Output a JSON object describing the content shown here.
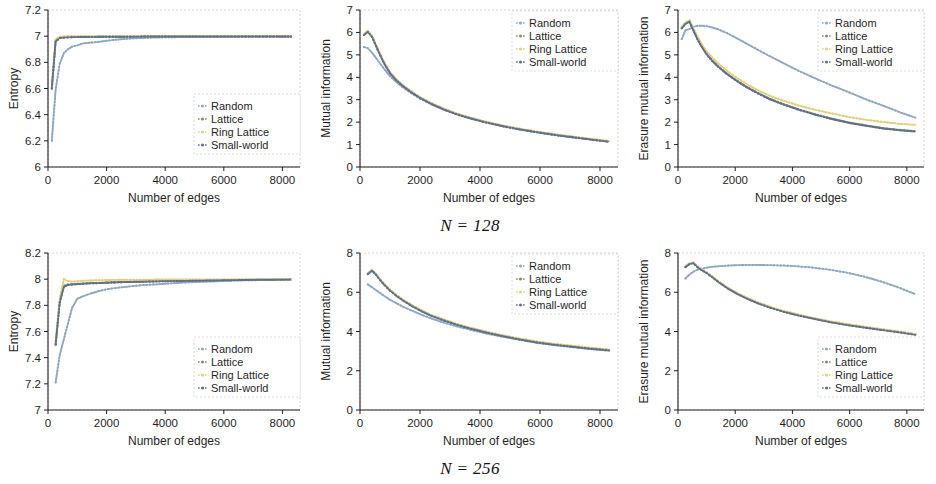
{
  "figure": {
    "captions": [
      {
        "text": "N = 128"
      },
      {
        "text": "N = 256"
      }
    ],
    "xlabel": "Number of edges",
    "series_names": [
      "Random",
      "Lattice",
      "Ring Lattice",
      "Small-world"
    ],
    "colors": {
      "random": "#8fa7c4",
      "lattice": "#7e8f6a",
      "ring_lattice": "#e3cf7a",
      "small_world": "#5f708a",
      "axis": "#1f1f1f",
      "frame": "#c9c9c9"
    }
  },
  "chart_data": [
    {
      "id": "entropy-n128",
      "type": "line",
      "title": "",
      "xlabel": "Number of edges",
      "ylabel": "Entropy",
      "xlim": [
        0,
        8600
      ],
      "ylim": [
        6,
        7.2
      ],
      "xticks": [
        0,
        2000,
        4000,
        6000,
        8000
      ],
      "yticks": [
        "6",
        "6.2",
        "6.4",
        "6.6",
        "6.8",
        "7",
        "7.2"
      ],
      "grid": false,
      "legend_position": "bottom-right",
      "x": [
        130,
        260,
        400,
        540,
        680,
        820,
        1000,
        1200,
        1400,
        1700,
        2000,
        2400,
        2800,
        3200,
        3700,
        4200,
        4800,
        5400,
        6000,
        6600,
        7200,
        7800,
        8300
      ],
      "series": [
        {
          "name": "Random",
          "values": [
            6.2,
            6.59,
            6.79,
            6.87,
            6.9,
            6.92,
            6.93,
            6.945,
            6.95,
            6.955,
            6.965,
            6.975,
            6.982,
            6.986,
            6.99,
            6.992,
            6.993,
            6.995,
            6.996,
            6.997,
            6.997,
            6.998,
            6.998
          ]
        },
        {
          "name": "Lattice",
          "values": [
            6.6,
            6.96,
            6.985,
            6.99,
            6.992,
            6.993,
            6.994,
            6.994,
            6.995,
            6.995,
            6.995,
            6.996,
            6.996,
            6.997,
            6.997,
            6.997,
            6.997,
            6.998,
            6.998,
            6.998,
            6.998,
            6.998,
            6.998
          ]
        },
        {
          "name": "Ring Lattice",
          "values": [
            6.61,
            6.975,
            6.995,
            6.998,
            6.999,
            6.999,
            6.999,
            6.999,
            6.999,
            6.999,
            6.999,
            6.999,
            6.999,
            6.999,
            6.999,
            6.999,
            6.999,
            6.999,
            6.999,
            6.999,
            6.999,
            6.999,
            6.999
          ]
        },
        {
          "name": "Small-world",
          "values": [
            6.6,
            6.96,
            6.985,
            6.989,
            6.991,
            6.992,
            6.993,
            6.994,
            6.994,
            6.995,
            6.995,
            6.996,
            6.996,
            6.997,
            6.997,
            6.997,
            6.998,
            6.998,
            6.998,
            6.998,
            6.998,
            6.998,
            6.998
          ]
        }
      ]
    },
    {
      "id": "mutual-information-n128",
      "type": "line",
      "title": "",
      "xlabel": "Number of edges",
      "ylabel": "Mutual information",
      "xlim": [
        0,
        8600
      ],
      "ylim": [
        0,
        7
      ],
      "xticks": [
        0,
        2000,
        4000,
        6000,
        8000
      ],
      "yticks": [
        "0",
        "1",
        "2",
        "3",
        "4",
        "5",
        "6",
        "7"
      ],
      "grid": false,
      "legend_position": "top-right",
      "x": [
        130,
        260,
        400,
        540,
        680,
        820,
        1000,
        1200,
        1400,
        1700,
        2000,
        2400,
        2800,
        3200,
        3700,
        4200,
        4800,
        5400,
        6000,
        6600,
        7200,
        7800,
        8300
      ],
      "series": [
        {
          "name": "Random",
          "values": [
            5.35,
            5.3,
            5.1,
            4.85,
            4.6,
            4.35,
            4.05,
            3.8,
            3.58,
            3.3,
            3.05,
            2.78,
            2.55,
            2.35,
            2.15,
            1.98,
            1.8,
            1.65,
            1.52,
            1.4,
            1.3,
            1.2,
            1.12
          ]
        },
        {
          "name": "Lattice",
          "values": [
            5.9,
            6.05,
            5.82,
            5.4,
            4.98,
            4.6,
            4.2,
            3.9,
            3.66,
            3.36,
            3.1,
            2.82,
            2.58,
            2.38,
            2.18,
            2.0,
            1.82,
            1.67,
            1.54,
            1.42,
            1.32,
            1.22,
            1.14
          ]
        },
        {
          "name": "Ring Lattice",
          "values": [
            5.92,
            6.08,
            5.85,
            5.43,
            5.02,
            4.64,
            4.23,
            3.93,
            3.68,
            3.38,
            3.12,
            2.84,
            2.6,
            2.4,
            2.2,
            2.02,
            1.84,
            1.69,
            1.56,
            1.44,
            1.34,
            1.24,
            1.16
          ]
        },
        {
          "name": "Small-world",
          "values": [
            5.88,
            6.02,
            5.8,
            5.38,
            4.96,
            4.58,
            4.18,
            3.88,
            3.64,
            3.34,
            3.08,
            2.8,
            2.56,
            2.36,
            2.16,
            1.99,
            1.81,
            1.66,
            1.53,
            1.41,
            1.31,
            1.21,
            1.13
          ]
        }
      ]
    },
    {
      "id": "erasure-mutual-information-n128",
      "type": "line",
      "title": "",
      "xlabel": "Number of edges",
      "ylabel": "Erasure mutual information",
      "xlim": [
        0,
        8600
      ],
      "ylim": [
        0,
        7
      ],
      "xticks": [
        0,
        2000,
        4000,
        6000,
        8000
      ],
      "yticks": [
        "0",
        "1",
        "2",
        "3",
        "4",
        "5",
        "6",
        "7"
      ],
      "grid": false,
      "legend_position": "top-right",
      "x": [
        130,
        260,
        400,
        540,
        680,
        820,
        1000,
        1200,
        1400,
        1700,
        2000,
        2400,
        2800,
        3200,
        3700,
        4200,
        4800,
        5400,
        6000,
        6600,
        7200,
        7800,
        8300
      ],
      "series": [
        {
          "name": "Random",
          "values": [
            5.7,
            6.1,
            6.15,
            6.25,
            6.3,
            6.3,
            6.28,
            6.22,
            6.14,
            5.98,
            5.78,
            5.5,
            5.22,
            4.95,
            4.62,
            4.3,
            3.95,
            3.62,
            3.32,
            3.0,
            2.72,
            2.42,
            2.2
          ]
        },
        {
          "name": "Lattice",
          "values": [
            6.2,
            6.4,
            6.5,
            6.1,
            5.72,
            5.4,
            5.05,
            4.75,
            4.5,
            4.18,
            3.9,
            3.58,
            3.3,
            3.05,
            2.8,
            2.58,
            2.35,
            2.15,
            1.98,
            1.85,
            1.73,
            1.65,
            1.6
          ]
        },
        {
          "name": "Ring Lattice",
          "values": [
            6.25,
            6.45,
            6.55,
            6.18,
            5.82,
            5.5,
            5.15,
            4.88,
            4.62,
            4.3,
            4.02,
            3.7,
            3.42,
            3.18,
            2.95,
            2.75,
            2.55,
            2.38,
            2.22,
            2.1,
            2.0,
            1.92,
            1.88
          ]
        },
        {
          "name": "Small-world",
          "values": [
            6.18,
            6.38,
            6.48,
            6.08,
            5.7,
            5.38,
            5.02,
            4.72,
            4.47,
            4.15,
            3.88,
            3.55,
            3.28,
            3.02,
            2.78,
            2.56,
            2.33,
            2.13,
            1.96,
            1.83,
            1.71,
            1.63,
            1.58
          ]
        }
      ]
    },
    {
      "id": "entropy-n256",
      "type": "line",
      "title": "",
      "xlabel": "Number of edges",
      "ylabel": "Entropy",
      "xlim": [
        0,
        8600
      ],
      "ylim": [
        7,
        8.2
      ],
      "xticks": [
        0,
        2000,
        4000,
        6000,
        8000
      ],
      "yticks": [
        "7",
        "7.2",
        "7.4",
        "7.6",
        "7.8",
        "8",
        "8.2"
      ],
      "grid": false,
      "legend_position": "bottom-right",
      "x": [
        260,
        400,
        540,
        680,
        820,
        1000,
        1200,
        1450,
        1750,
        2050,
        2400,
        2800,
        3250,
        3700,
        4200,
        4700,
        5300,
        5900,
        6500,
        7100,
        7700,
        8300
      ],
      "series": [
        {
          "name": "Random",
          "values": [
            7.21,
            7.42,
            7.54,
            7.66,
            7.78,
            7.85,
            7.87,
            7.89,
            7.91,
            7.925,
            7.935,
            7.945,
            7.955,
            7.96,
            7.968,
            7.975,
            7.98,
            7.985,
            7.99,
            7.992,
            7.995,
            7.998
          ]
        },
        {
          "name": "Lattice",
          "values": [
            7.5,
            7.83,
            7.95,
            7.96,
            7.962,
            7.965,
            7.967,
            7.97,
            7.972,
            7.975,
            7.978,
            7.98,
            7.982,
            7.984,
            7.986,
            7.988,
            7.99,
            7.992,
            7.994,
            7.996,
            7.997,
            7.998
          ]
        },
        {
          "name": "Ring Lattice",
          "values": [
            7.52,
            7.85,
            8.0,
            7.985,
            7.982,
            7.984,
            7.988,
            7.99,
            7.992,
            7.994,
            7.995,
            7.996,
            7.996,
            7.997,
            7.997,
            7.998,
            7.998,
            7.998,
            7.999,
            7.999,
            7.999,
            7.999
          ]
        },
        {
          "name": "Small-world",
          "values": [
            7.5,
            7.82,
            7.94,
            7.955,
            7.958,
            7.962,
            7.965,
            7.968,
            7.97,
            7.973,
            7.976,
            7.979,
            7.981,
            7.983,
            7.985,
            7.987,
            7.989,
            7.991,
            7.993,
            7.995,
            7.996,
            7.997
          ]
        }
      ]
    },
    {
      "id": "mutual-information-n256",
      "type": "line",
      "title": "",
      "xlabel": "Number of edges",
      "ylabel": "Mutual information",
      "xlim": [
        0,
        8600
      ],
      "ylim": [
        0,
        8
      ],
      "xticks": [
        0,
        2000,
        4000,
        6000,
        8000
      ],
      "yticks": [
        "0",
        "2",
        "4",
        "6",
        "8"
      ],
      "grid": false,
      "legend_position": "top-right",
      "x": [
        260,
        400,
        540,
        680,
        820,
        1000,
        1200,
        1450,
        1750,
        2050,
        2400,
        2800,
        3250,
        3700,
        4200,
        4700,
        5300,
        5900,
        6500,
        7100,
        7700,
        8300
      ],
      "series": [
        {
          "name": "Random",
          "values": [
            6.4,
            6.25,
            6.1,
            5.95,
            5.8,
            5.62,
            5.45,
            5.25,
            5.05,
            4.85,
            4.65,
            4.45,
            4.25,
            4.08,
            3.9,
            3.75,
            3.58,
            3.42,
            3.3,
            3.2,
            3.1,
            3.02
          ]
        },
        {
          "name": "Lattice",
          "values": [
            6.95,
            7.12,
            6.9,
            6.62,
            6.38,
            6.1,
            5.85,
            5.58,
            5.3,
            5.05,
            4.8,
            4.58,
            4.35,
            4.16,
            3.97,
            3.8,
            3.62,
            3.46,
            3.34,
            3.24,
            3.14,
            3.06
          ]
        },
        {
          "name": "Ring Lattice",
          "values": [
            6.98,
            7.15,
            6.93,
            6.66,
            6.42,
            6.14,
            5.88,
            5.61,
            5.33,
            5.08,
            4.83,
            4.61,
            4.38,
            4.19,
            4.0,
            3.83,
            3.65,
            3.49,
            3.37,
            3.27,
            3.17,
            3.09
          ]
        },
        {
          "name": "Small-world",
          "values": [
            6.92,
            7.1,
            6.88,
            6.6,
            6.36,
            6.08,
            5.83,
            5.56,
            5.28,
            5.03,
            4.78,
            4.56,
            4.33,
            4.14,
            3.95,
            3.78,
            3.6,
            3.44,
            3.32,
            3.22,
            3.12,
            3.04
          ]
        }
      ]
    },
    {
      "id": "erasure-mutual-information-n256",
      "type": "line",
      "title": "",
      "xlabel": "Number of edges",
      "ylabel": "Erasure mutual information",
      "xlim": [
        0,
        8600
      ],
      "ylim": [
        0,
        8
      ],
      "xticks": [
        0,
        2000,
        4000,
        6000,
        8000
      ],
      "yticks": [
        "0",
        "2",
        "4",
        "6",
        "8"
      ],
      "grid": false,
      "legend_position": "bottom-right",
      "x": [
        260,
        400,
        540,
        680,
        820,
        1000,
        1200,
        1450,
        1750,
        2050,
        2400,
        2800,
        3250,
        3700,
        4200,
        4700,
        5300,
        5900,
        6500,
        7100,
        7700,
        8300
      ],
      "series": [
        {
          "name": "Random",
          "values": [
            6.7,
            6.9,
            7.05,
            7.15,
            7.2,
            7.25,
            7.3,
            7.33,
            7.36,
            7.38,
            7.39,
            7.39,
            7.38,
            7.36,
            7.32,
            7.26,
            7.15,
            7.0,
            6.8,
            6.55,
            6.25,
            5.9
          ]
        },
        {
          "name": "Lattice",
          "values": [
            7.3,
            7.45,
            7.5,
            7.3,
            7.15,
            7.0,
            6.78,
            6.5,
            6.2,
            5.95,
            5.7,
            5.45,
            5.22,
            5.02,
            4.84,
            4.68,
            4.5,
            4.35,
            4.22,
            4.1,
            3.98,
            3.85
          ]
        },
        {
          "name": "Ring Lattice",
          "values": [
            7.32,
            7.48,
            7.52,
            7.33,
            7.18,
            7.02,
            6.8,
            6.53,
            6.23,
            5.98,
            5.73,
            5.48,
            5.25,
            5.05,
            4.87,
            4.7,
            4.53,
            4.38,
            4.25,
            4.13,
            4.0,
            3.88
          ]
        },
        {
          "name": "Small-world",
          "values": [
            7.28,
            7.43,
            7.48,
            7.28,
            7.13,
            6.98,
            6.76,
            6.48,
            6.18,
            5.93,
            5.68,
            5.43,
            5.2,
            5.0,
            4.82,
            4.66,
            4.48,
            4.33,
            4.2,
            4.08,
            3.96,
            3.83
          ]
        }
      ]
    }
  ]
}
